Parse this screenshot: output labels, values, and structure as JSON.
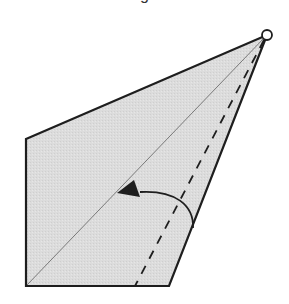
{
  "diagram": {
    "title_fragment": "g",
    "colors": {
      "fill": "#dcdcdc",
      "stroke": "#1e1e1e",
      "background": "#ffffff"
    },
    "shape": {
      "type": "folded-paper-polygon",
      "vertices": [
        [
          26,
          139
        ],
        [
          267,
          35
        ],
        [
          169,
          286
        ],
        [
          26,
          286
        ]
      ]
    },
    "pivot_point": {
      "x": 267,
      "y": 35,
      "r": 5
    },
    "fold_line": {
      "style": "thin",
      "from": [
        26,
        286
      ],
      "to": [
        265,
        37
      ]
    },
    "crease_line": {
      "style": "dashed",
      "from": [
        264,
        40
      ],
      "to": [
        135,
        286
      ]
    },
    "rotation_arrow": {
      "direction": "counterclockwise",
      "from": [
        193,
        228
      ],
      "to": [
        117,
        193
      ]
    }
  }
}
